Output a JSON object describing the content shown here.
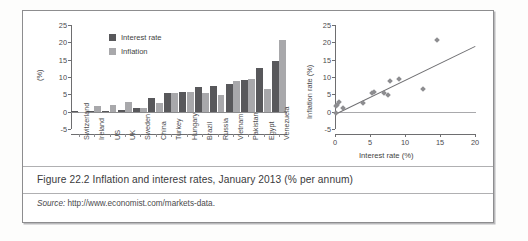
{
  "figure": {
    "caption": "Figure 22.2  Inflation and interest rates, January 2013 (% per annum)",
    "source_label": "Source:",
    "source_url": "http://www.economist.com/markets-data."
  },
  "colors": {
    "interest_rate": "#58585b",
    "inflation": "#a8a8ab",
    "axis": "#6e6e70",
    "fit_line": "#6f6f72",
    "point": "#8d8d90",
    "frame": "#8d8d8f"
  },
  "chart_data": [
    {
      "type": "bar",
      "id": "bar-chart",
      "title": "",
      "xlabel": "",
      "ylabel": "(%)",
      "ylim": [
        -5,
        25
      ],
      "yticks": [
        -5,
        0,
        5,
        10,
        15,
        20,
        25
      ],
      "grid": false,
      "legend_position": "top-left",
      "categories": [
        "Switzerland",
        "Ireland",
        "US",
        "UK",
        "Sweden",
        "China",
        "Turkey",
        "Hungary",
        "Brazil",
        "Russia",
        "Vietnam",
        "Pakistan",
        "Egypt",
        "Venezuela"
      ],
      "series": [
        {
          "name": "Interest rate",
          "values": [
            0.1,
            0.2,
            0.25,
            0.5,
            1.2,
            4.0,
            5.3,
            5.6,
            7.0,
            7.5,
            7.9,
            9.2,
            12.5,
            14.6
          ]
        },
        {
          "name": "Inflation",
          "values": [
            -0.4,
            1.7,
            1.8,
            2.7,
            1.1,
            2.5,
            5.5,
            5.6,
            5.4,
            4.9,
            8.8,
            9.5,
            6.6,
            20.8
          ]
        }
      ]
    },
    {
      "type": "scatter",
      "id": "scatter-chart",
      "title": "",
      "xlabel": "Interest rate (%)",
      "ylabel": "Inflation rate (%)",
      "xlim": [
        0,
        20
      ],
      "ylim": [
        -5,
        25
      ],
      "xticks": [
        0,
        5,
        10,
        15,
        20
      ],
      "yticks": [
        -5,
        0,
        5,
        10,
        15,
        20,
        25
      ],
      "grid": false,
      "points": [
        {
          "x": 0.1,
          "y": -0.4
        },
        {
          "x": 0.2,
          "y": 1.7
        },
        {
          "x": 0.25,
          "y": 1.8
        },
        {
          "x": 0.5,
          "y": 2.7
        },
        {
          "x": 1.2,
          "y": 1.1
        },
        {
          "x": 4.0,
          "y": 2.5
        },
        {
          "x": 5.3,
          "y": 5.5
        },
        {
          "x": 5.6,
          "y": 5.6
        },
        {
          "x": 7.0,
          "y": 5.4
        },
        {
          "x": 7.5,
          "y": 4.9
        },
        {
          "x": 7.9,
          "y": 8.8
        },
        {
          "x": 9.2,
          "y": 9.5
        },
        {
          "x": 12.5,
          "y": 6.6
        },
        {
          "x": 14.6,
          "y": 20.8
        }
      ],
      "fit_line": {
        "x0": 0,
        "y0": -0.6,
        "x1": 20,
        "y1": 19.0,
        "visible": true
      }
    }
  ]
}
